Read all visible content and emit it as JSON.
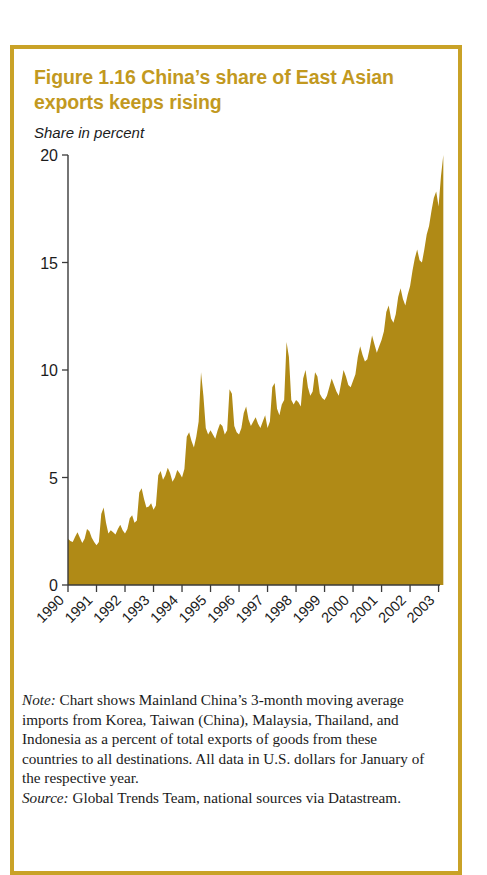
{
  "figure": {
    "title": "Figure 1.16  China’s share of East Asian exports keeps rising",
    "subtitle": "Share in percent",
    "frame_color": "#c9a227",
    "title_color": "#c2991f"
  },
  "note": {
    "lead": "Note:",
    "body": " Chart shows Mainland China’s 3-month moving average imports from Korea, Taiwan (China), Malaysia, Thailand, and Indonesia as a percent of total exports of goods from these countries to all destinations. All data in U.S. dollars for January of the respective year."
  },
  "source": {
    "lead": "Source:",
    "body": " Global Trends Team, national sources via Datastream."
  },
  "chart_data": {
    "type": "area",
    "title": "China’s share of East Asian exports keeps rising",
    "xlabel": "",
    "ylabel": "Share in percent",
    "ylim": [
      0,
      20
    ],
    "yticks": [
      0,
      5,
      10,
      15,
      20
    ],
    "ytick_labels": [
      "0",
      "5",
      "10",
      "15",
      "20"
    ],
    "xlim": [
      1990,
      2003.05
    ],
    "xticks": [
      1990,
      1991,
      1992,
      1993,
      1994,
      1995,
      1996,
      1997,
      1998,
      1999,
      2000,
      2001,
      2002,
      2003
    ],
    "xtick_labels": [
      "1990",
      "1991",
      "1992",
      "1993",
      "1994",
      "1995",
      "1996",
      "1997",
      "1998",
      "1999",
      "2000",
      "2001",
      "2002",
      "2003"
    ],
    "grid": false,
    "legend": "none",
    "fill_color": "#b08a16",
    "axis_color": "#3a3a3a",
    "series": [
      {
        "name": "China’s share of East Asian exports",
        "x_start": 1990.0,
        "x_step": 0.083333,
        "values": [
          2.15,
          2.05,
          2.0,
          2.25,
          2.45,
          2.2,
          1.95,
          2.15,
          2.6,
          2.5,
          2.2,
          2.0,
          1.85,
          2.0,
          3.3,
          3.6,
          2.9,
          2.4,
          2.55,
          2.45,
          2.35,
          2.6,
          2.8,
          2.55,
          2.4,
          2.6,
          3.1,
          3.25,
          2.9,
          3.0,
          4.3,
          4.5,
          4.0,
          3.6,
          3.65,
          3.8,
          3.5,
          3.7,
          5.1,
          5.3,
          4.9,
          5.1,
          5.45,
          5.2,
          4.8,
          5.0,
          5.35,
          5.2,
          5.0,
          5.4,
          6.9,
          7.1,
          6.7,
          6.4,
          6.9,
          7.6,
          9.9,
          8.8,
          7.3,
          7.0,
          7.2,
          7.0,
          6.8,
          7.2,
          7.5,
          7.4,
          7.0,
          7.2,
          9.1,
          8.9,
          7.4,
          7.1,
          7.0,
          7.3,
          8.0,
          8.3,
          7.7,
          7.4,
          7.6,
          7.8,
          7.5,
          7.3,
          7.6,
          7.9,
          7.3,
          7.6,
          9.2,
          9.4,
          8.2,
          7.9,
          8.4,
          8.6,
          11.3,
          10.6,
          8.6,
          8.4,
          8.6,
          8.5,
          8.3,
          9.6,
          10.0,
          9.2,
          8.8,
          9.0,
          9.9,
          9.7,
          8.9,
          8.7,
          8.6,
          8.8,
          9.2,
          9.6,
          9.3,
          9.0,
          8.8,
          9.4,
          10.0,
          9.7,
          9.3,
          9.2,
          9.5,
          9.8,
          10.6,
          11.1,
          10.7,
          10.4,
          10.5,
          11.0,
          11.6,
          11.2,
          10.8,
          11.1,
          11.4,
          11.8,
          12.7,
          13.0,
          12.4,
          12.2,
          12.6,
          13.4,
          13.8,
          13.3,
          13.0,
          13.5,
          13.9,
          14.6,
          15.2,
          15.6,
          15.1,
          15.0,
          15.6,
          16.3,
          16.7,
          17.4,
          18.0,
          18.3,
          17.6,
          19.0,
          20.0
        ]
      }
    ]
  }
}
